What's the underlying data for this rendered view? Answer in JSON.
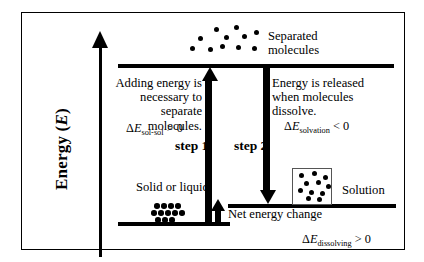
{
  "diagram": {
    "axis": {
      "label_text": "Energy (",
      "label_symbol": "E",
      "label_close": ")",
      "icon": "up-arrow-icon"
    },
    "levels": [
      {
        "name": "separated-molecules-level",
        "position": "top"
      },
      {
        "name": "solution-level",
        "position": "middle"
      },
      {
        "name": "solid-or-liquid-level",
        "position": "bottom"
      }
    ],
    "steps": [
      {
        "caption": "step 1",
        "direction": "up"
      },
      {
        "caption": "step 2",
        "direction": "down"
      }
    ],
    "paragraphs": {
      "left": "Adding energy is necessary to separate molecules.",
      "right": "Energy is released when molecules dissolve."
    },
    "equations": {
      "sol_sol": {
        "delta": "Δ",
        "symbol": "E",
        "subscript": "sol-sol",
        "relation": " > 0"
      },
      "solvation": {
        "delta": "Δ",
        "symbol": "E",
        "subscript": "solvation",
        "relation": " < 0"
      },
      "dissolving": {
        "delta": "Δ",
        "symbol": "E",
        "subscript": "dissolving",
        "relation": " > 0"
      }
    },
    "labels": {
      "separated_line1": "Separated",
      "separated_line2": "molecules",
      "solid_or_liquid": "Solid or liquid",
      "solution": "Solution",
      "net_energy_change": "Net energy change"
    },
    "molecule_groups": {
      "separated": {
        "name": "separated-molecules-dots",
        "count": 11,
        "dots": [
          [
            24,
            2
          ],
          [
            44,
            0
          ],
          [
            8,
            11
          ],
          [
            34,
            10
          ],
          [
            52,
            9
          ],
          [
            64,
            5
          ],
          [
            0,
            21
          ],
          [
            18,
            22
          ],
          [
            30,
            19
          ],
          [
            46,
            20
          ],
          [
            62,
            21
          ]
        ]
      },
      "lattice": {
        "name": "solid-lattice-dots",
        "count": 12,
        "dots": [
          [
            4,
            0
          ],
          [
            11,
            0
          ],
          [
            18,
            0
          ],
          [
            25,
            0
          ],
          [
            1,
            7
          ],
          [
            8,
            7
          ],
          [
            15,
            7
          ],
          [
            22,
            7
          ],
          [
            29,
            7
          ],
          [
            5,
            14
          ],
          [
            12,
            14
          ],
          [
            19,
            14
          ]
        ]
      },
      "solution": {
        "name": "solution-dots",
        "count": 11,
        "dots": [
          [
            6,
            4
          ],
          [
            19,
            2
          ],
          [
            30,
            6
          ],
          [
            11,
            12
          ],
          [
            23,
            11
          ],
          [
            33,
            15
          ],
          [
            5,
            19
          ],
          [
            16,
            21
          ],
          [
            27,
            22
          ],
          [
            13,
            27
          ],
          [
            24,
            28
          ]
        ]
      }
    },
    "colors": {
      "ink": "#000000",
      "background": "#ffffff",
      "box_border": "#555555"
    }
  }
}
